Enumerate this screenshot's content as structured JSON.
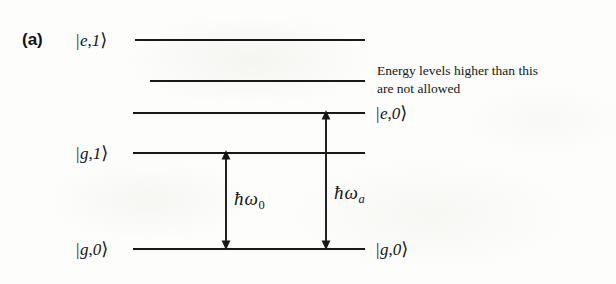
{
  "figure": {
    "panel_label": "(a)",
    "caption_annotation": "Energy levels higher than this are not allowed",
    "annotation_line_1": "Energy levels higher than this",
    "annotation_line_2": "are not allowed",
    "background_color": "#fdfdfb",
    "ink_color": "#181818"
  },
  "levels": [
    {
      "id": "e1",
      "label_left": "|e,1⟩",
      "ket_bar": "|",
      "ket_state": "e",
      "ket_comma": ",",
      "ket_photon": "1",
      "ket_close": "⟩",
      "label_side": "left",
      "y": 39
    },
    {
      "id": "unlabeled-upper",
      "label_left": "",
      "label_side": "none",
      "y": 80
    },
    {
      "id": "e0",
      "label_right": "|e,0⟩",
      "ket_bar": "|",
      "ket_state": "e",
      "ket_comma": ",",
      "ket_photon": "0",
      "ket_close": "⟩",
      "label_side": "right",
      "y": 112
    },
    {
      "id": "g1",
      "label_left": "|g,1⟩",
      "ket_bar": "|",
      "ket_state": "g",
      "ket_comma": ",",
      "ket_photon": "1",
      "ket_close": "⟩",
      "label_side": "left",
      "y": 152
    },
    {
      "id": "g0",
      "label_left": "|g,0⟩",
      "label_right": "|g,0⟩",
      "ket_bar": "|",
      "ket_state": "g",
      "ket_comma": ",",
      "ket_photon": "0",
      "ket_close": "⟩",
      "label_side": "both",
      "y": 248
    }
  ],
  "transitions": [
    {
      "id": "omega-0",
      "label": "ħω₀",
      "hbar": "ħ",
      "omega": "ω",
      "subscript": "0",
      "subscript_italic": false,
      "from_level": "g1",
      "to_level": "g0",
      "x": 225,
      "y_top": 152,
      "y_bottom": 248
    },
    {
      "id": "omega-a",
      "label": "ħωₐ",
      "hbar": "ħ",
      "omega": "ω",
      "subscript": "a",
      "subscript_italic": true,
      "from_level": "e0",
      "to_level": "g0",
      "x": 325,
      "y_top": 112,
      "y_bottom": 248
    }
  ]
}
